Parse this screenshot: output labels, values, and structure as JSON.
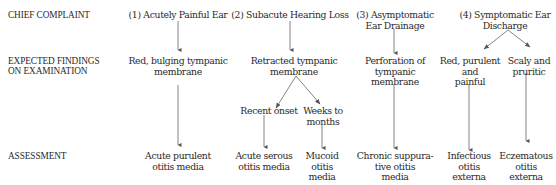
{
  "row_labels": {
    "chief_complaint": "CHIEF COMPLAINT",
    "findings_line1": "EXPECTED FINDINGS",
    "findings_line2": "ON EXAMINATION",
    "assessment": "ASSESSMENT"
  },
  "complaints": [
    {
      "label": "(1) Acutely Painful Ear"
    },
    {
      "label": "(2) Subacute Hearing Loss"
    },
    {
      "label_line1": "(3) Asymptomatic",
      "label_line2": "Ear Drainage"
    },
    {
      "label_line1": "(4) Symptomatic Ear",
      "label_line2": "Discharge"
    }
  ],
  "findings": {
    "c1": {
      "line1": "Red, bulging tympanic",
      "line2": "membrane"
    },
    "c2": {
      "line1": "Retracted tympanic",
      "line2": "membrane"
    },
    "c2_branch_a": "Recent onset",
    "c2_branch_b": {
      "line1": "Weeks to",
      "line2": "months"
    },
    "c3": {
      "line1": "Perforation of",
      "line2": "tympanic",
      "line3": "membrane"
    },
    "c4a": {
      "line1": "Red, purulent",
      "line2": "and",
      "line3": "painful"
    },
    "c4b": {
      "line1": "Scaly and",
      "line2": "pruritic"
    }
  },
  "assessments": {
    "c1": {
      "line1": "Acute purulent",
      "line2": "otitis media"
    },
    "c2a": {
      "line1": "Acute serous",
      "line2": "otitis media"
    },
    "c2b": {
      "line1": "Mucoid",
      "line2": "otitis",
      "line3": "media"
    },
    "c3": {
      "line1": "Chronic suppura-",
      "line2": "tive otitis",
      "line3": "media"
    },
    "c4a": {
      "line1": "Infectious",
      "line2": "otitis",
      "line3": "externa"
    },
    "c4b": {
      "line1": "Eczematous",
      "line2": "otitis",
      "line3": "externa"
    }
  },
  "colors": {
    "text": "#2a2a2a",
    "arrow": "#555555",
    "background": "#ffffff"
  }
}
